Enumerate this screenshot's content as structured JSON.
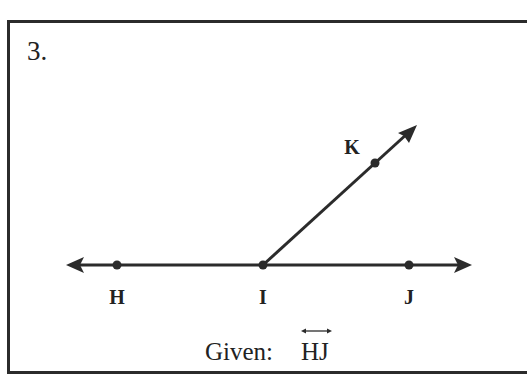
{
  "problem": {
    "number": "3.",
    "given_prefix": "Given: ",
    "given_object": "HJ",
    "given_notation": "line (double-headed arrow over HJ)"
  },
  "diagram": {
    "line": {
      "from": "H",
      "to": "J",
      "type": "line",
      "arrows": "both"
    },
    "ray": {
      "from": "I",
      "through": "K",
      "type": "ray"
    },
    "points": [
      {
        "label": "H",
        "x": 117,
        "y": 265
      },
      {
        "label": "I",
        "x": 263,
        "y": 265
      },
      {
        "label": "J",
        "x": 409,
        "y": 265
      },
      {
        "label": "K",
        "x": 375,
        "y": 163
      }
    ],
    "colors": {
      "stroke": "#2b2b2b",
      "text": "#222222",
      "background": "#ffffff"
    }
  }
}
